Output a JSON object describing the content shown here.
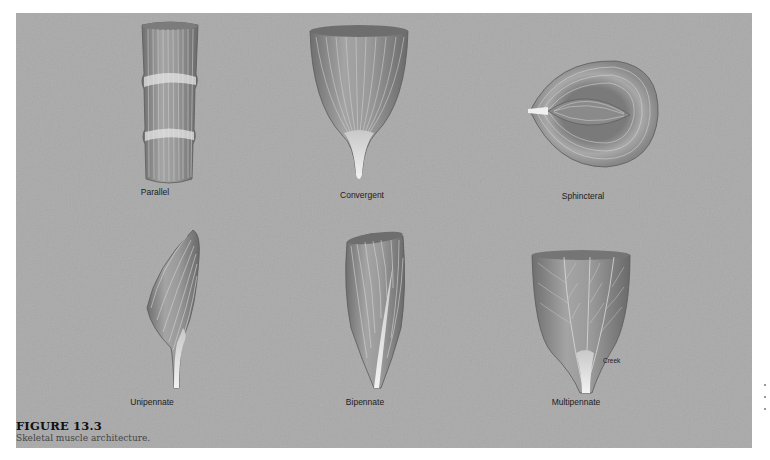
{
  "figure": {
    "number": "FIGURE 13.3",
    "caption": "Skeletal muscle architecture."
  },
  "panels": [
    {
      "id": "parallel",
      "label": "Parallel"
    },
    {
      "id": "convergent",
      "label": "Convergent"
    },
    {
      "id": "sphincteral",
      "label": "Sphincteral"
    },
    {
      "id": "unipennate",
      "label": "Unipennate"
    },
    {
      "id": "bipennate",
      "label": "Bipennate"
    },
    {
      "id": "multipennate",
      "label": "Multipennate",
      "callout": "Creek"
    }
  ],
  "colors": {
    "background": "#a9a9a9",
    "muscle_fill": "#8e8e8e",
    "fiber_light": "#d8d8d8",
    "tendon": "#e8e8e8",
    "page": "#ffffff"
  }
}
